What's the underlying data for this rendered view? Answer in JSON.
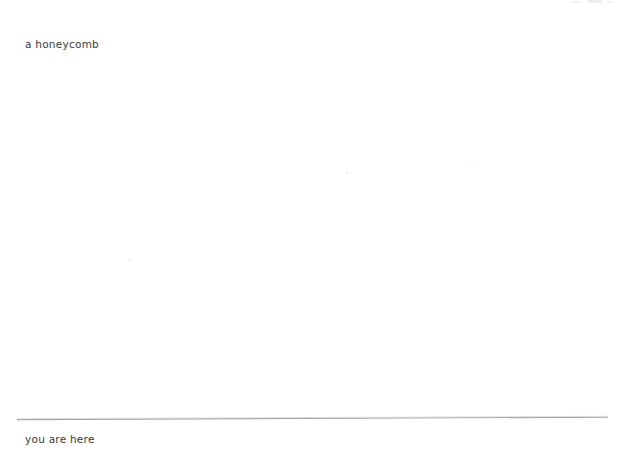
{
  "page": {
    "background_color": "#ffffff",
    "width": 620,
    "height": 455
  },
  "content": {
    "top_caption": "a honeycomb",
    "bottom_caption": "you are here"
  },
  "divider": {
    "name": "horizontal-rule",
    "color": "#a3a3a3",
    "thickness_px": 1
  },
  "text_style": {
    "color": "#3b3b3b",
    "size_px": 10.5
  }
}
